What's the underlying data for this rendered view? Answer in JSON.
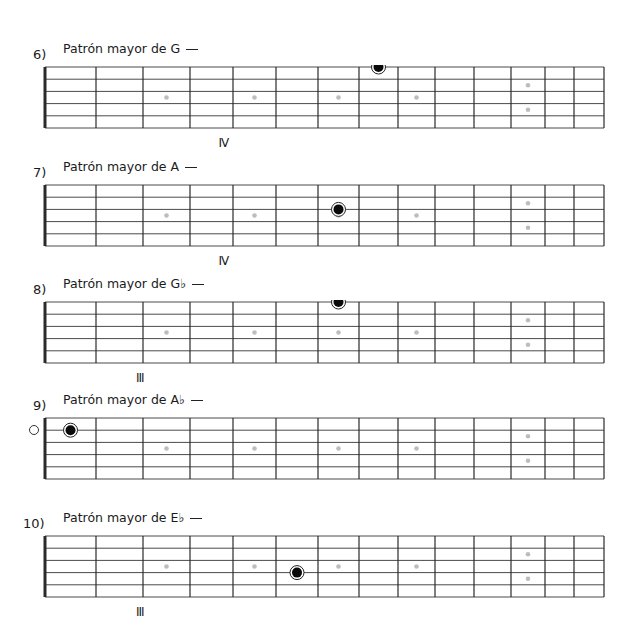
{
  "board": {
    "frets_x": [
      45,
      96,
      143,
      190,
      233,
      276,
      318,
      359,
      398,
      435,
      474,
      511,
      545,
      574,
      604
    ],
    "string_count": 6,
    "height": 61,
    "inlay_color": "#bdbdbd",
    "inlays": [
      {
        "fret": 3,
        "rows": [
          2.5
        ]
      },
      {
        "fret": 5,
        "rows": [
          2.5
        ]
      },
      {
        "fret": 7,
        "rows": [
          2.5
        ]
      },
      {
        "fret": 9,
        "rows": [
          2.5
        ]
      },
      {
        "fret": 12,
        "rows": [
          1.5,
          3.5
        ]
      }
    ]
  },
  "exercises": [
    {
      "number": "6)",
      "title": "Patrón mayor de G",
      "top": 67,
      "position_label": "IV",
      "position_fret": 4,
      "open_marker": false,
      "notes": [
        {
          "fret": 8,
          "string": 1
        }
      ]
    },
    {
      "number": "7)",
      "title": "Patrón mayor de A",
      "top": 185,
      "position_label": "IV",
      "position_fret": 4,
      "open_marker": false,
      "notes": [
        {
          "fret": 7,
          "string": 3
        }
      ]
    },
    {
      "number": "8)",
      "title": "Patrón mayor de G♭",
      "top": 302,
      "position_label": "III",
      "position_fret": 3,
      "open_marker": false,
      "notes": [
        {
          "fret": 7,
          "string": 1
        }
      ]
    },
    {
      "number": "9)",
      "title": "Patrón mayor de A♭",
      "top": 418,
      "position_label": "",
      "position_fret": null,
      "open_marker": true,
      "notes": [
        {
          "fret": 1,
          "string": 2
        }
      ]
    },
    {
      "number": "10)",
      "title": "Patrón mayor de E♭",
      "top": 536,
      "position_label": "III",
      "position_fret": 3,
      "open_marker": false,
      "notes": [
        {
          "fret": 6,
          "string": 4
        }
      ]
    }
  ]
}
